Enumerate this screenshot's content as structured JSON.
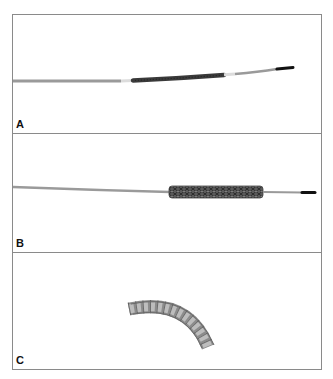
{
  "figure": {
    "panels": [
      {
        "id": "A",
        "label": "A",
        "description": "Crimped stent on delivery catheter with guidewire tip",
        "colors": {
          "catheter": "#9a9a9a",
          "marker": "#dcdcdc",
          "stent": "#3a3a3a",
          "tip": "#111111"
        }
      },
      {
        "id": "B",
        "label": "B",
        "description": "Mesh stent mounted on delivery system",
        "colors": {
          "catheter": "#9a9a9a",
          "stent": "#555555",
          "tip": "#111111"
        }
      },
      {
        "id": "C",
        "label": "C",
        "description": "Deployed curved stent segment",
        "colors": {
          "stent": "#8c8c8c",
          "struts": "#4a4a4a"
        }
      }
    ],
    "border_color": "#8a8a8a"
  }
}
